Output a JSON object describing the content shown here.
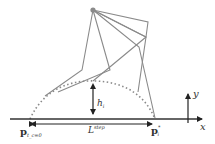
{
  "diagram": {
    "labels": {
      "start_point": "p",
      "start_point_sub": "t_c=0",
      "end_point": "p",
      "end_point_sub": "i",
      "end_point_sup": "*",
      "step_length": "L",
      "step_length_sup": "step",
      "height": "h",
      "height_sub": "i",
      "x_axis": "x",
      "y_axis": "y"
    },
    "colors": {
      "leg": "#8a8a8a",
      "hip": "#8a8a8a",
      "axis": "#222222"
    }
  }
}
